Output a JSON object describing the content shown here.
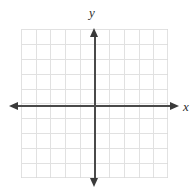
{
  "figure": {
    "type": "coordinate-plane",
    "title": "",
    "background_color": "#ffffff"
  },
  "axes": {
    "x_axis": {
      "label": "x",
      "color": "#4a4a4a",
      "arrowheads": [
        "left",
        "right"
      ],
      "arrow_color": "#3a3a3a"
    },
    "y_axis": {
      "label": "y",
      "color": "#4a4a4a",
      "arrowheads": [
        "top",
        "bottom"
      ],
      "arrow_color": "#3a3a3a"
    },
    "origin_shown": true,
    "tick_labels_shown": false,
    "tick_marks_shown": false
  },
  "grid": {
    "visible": true,
    "color": "#d8d8d8",
    "columns": 10,
    "rows": 10,
    "cell_width_px": 14.7,
    "cell_height_px": 14.9
  },
  "chart_data": {
    "type": "scatter",
    "title": "",
    "xlabel": "x",
    "ylabel": "y",
    "x": [],
    "y": [],
    "series": [],
    "xlim": [
      -5,
      5
    ],
    "ylim": [
      -5,
      5
    ],
    "xticks": [
      -5,
      -4,
      -3,
      -2,
      -1,
      0,
      1,
      2,
      3,
      4,
      5
    ],
    "yticks": [
      -5,
      -4,
      -3,
      -2,
      -1,
      0,
      1,
      2,
      3,
      4,
      5
    ],
    "xticklabels": [
      "",
      "",
      "",
      "",
      "",
      "",
      "",
      "",
      "",
      "",
      ""
    ],
    "yticklabels": [
      "",
      "",
      "",
      "",
      "",
      "",
      "",
      "",
      "",
      "",
      ""
    ],
    "grid": true,
    "legend": [],
    "legend_position": "none",
    "annotations": []
  }
}
